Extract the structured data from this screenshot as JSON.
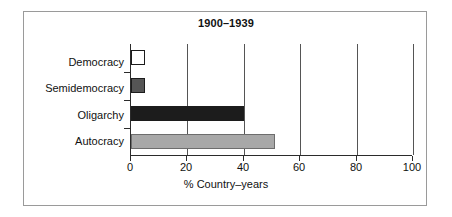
{
  "chart_data": {
    "type": "bar",
    "orientation": "horizontal",
    "title": "1900–1939",
    "xlabel": "% Country–years",
    "ylabel": "",
    "categories": [
      "Democracy",
      "Semidemocracy",
      "Oligarchy",
      "Autocracy"
    ],
    "values": [
      5,
      5,
      40,
      51
    ],
    "xlim": [
      0,
      100
    ],
    "xticks": [
      0,
      20,
      40,
      60,
      80,
      100
    ],
    "xtick_labels": [
      "0",
      "20",
      "40",
      "60",
      "80",
      "100"
    ],
    "grid": "vertical",
    "legend": "none",
    "bar_colors": [
      "#ffffff",
      "#555555",
      "#1c1c1c",
      "#a8a8a8"
    ],
    "bar_edge_color": "#1c1c1c",
    "series": [
      {
        "name": "% Country-years",
        "points": [
          {
            "category": "Democracy",
            "value": 5,
            "color": "#ffffff"
          },
          {
            "category": "Semidemocracy",
            "value": 5,
            "color": "#555555"
          },
          {
            "category": "Oligarchy",
            "value": 40,
            "color": "#1c1c1c"
          },
          {
            "category": "Autocracy",
            "value": 51,
            "color": "#a8a8a8"
          }
        ]
      }
    ]
  },
  "figure": {
    "frame_color": "#9a9a9a",
    "background": "#ffffff",
    "axis_color": "#2b2b2b",
    "grid_color": "#555555"
  }
}
